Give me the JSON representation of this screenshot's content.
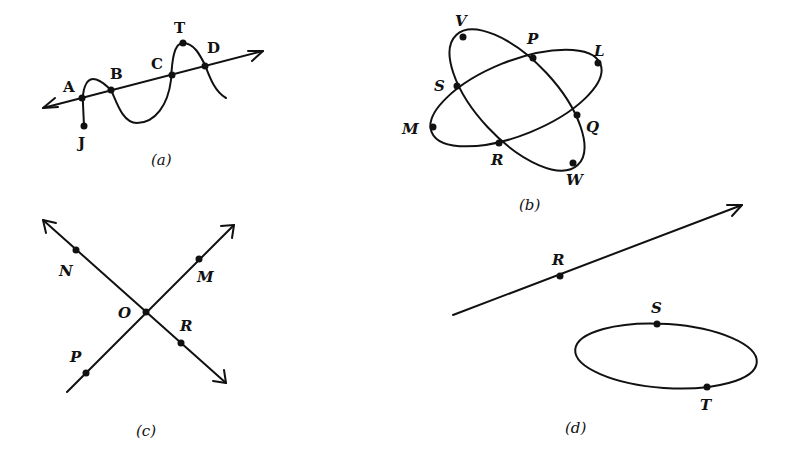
{
  "figures": [
    {
      "id": "a",
      "caption": "(a)",
      "description": "Line with arrows at both ends intersected by a wavy curve starting at J",
      "points": [
        {
          "name": "A",
          "label": "A"
        },
        {
          "name": "B",
          "label": "B"
        },
        {
          "name": "C",
          "label": "C"
        },
        {
          "name": "D",
          "label": "D"
        },
        {
          "name": "T",
          "label": "T"
        },
        {
          "name": "J",
          "label": "J"
        }
      ]
    },
    {
      "id": "b",
      "caption": "(b)",
      "description": "Two intersecting ellipses",
      "points": [
        {
          "name": "V",
          "label": "V"
        },
        {
          "name": "P",
          "label": "P"
        },
        {
          "name": "L",
          "label": "L"
        },
        {
          "name": "S",
          "label": "S"
        },
        {
          "name": "Q",
          "label": "Q"
        },
        {
          "name": "M",
          "label": "M"
        },
        {
          "name": "R",
          "label": "R"
        },
        {
          "name": "W",
          "label": "W"
        }
      ]
    },
    {
      "id": "c",
      "caption": "(c)",
      "description": "Two intersecting lines crossing at O",
      "points": [
        {
          "name": "N",
          "label": "N"
        },
        {
          "name": "M",
          "label": "M"
        },
        {
          "name": "O",
          "label": "O"
        },
        {
          "name": "R",
          "label": "R"
        },
        {
          "name": "P",
          "label": "P"
        }
      ]
    },
    {
      "id": "d",
      "caption": "(d)",
      "description": "A ray through R and a separate ellipse through S and T",
      "points": [
        {
          "name": "R",
          "label": "R"
        },
        {
          "name": "S",
          "label": "S"
        },
        {
          "name": "T",
          "label": "T"
        }
      ]
    }
  ]
}
